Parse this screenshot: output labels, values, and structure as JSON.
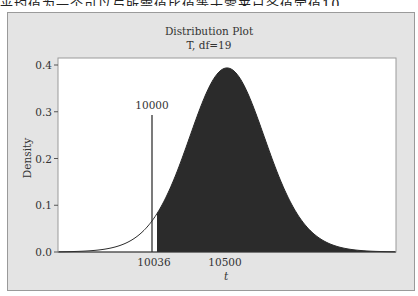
{
  "page_fragment": "平均值为一个可以与所需值比值等于零来已各值定值10",
  "chart_data": {
    "type": "area",
    "title": "Distribution Plot",
    "subtitle": "T, df=19",
    "xlabel": "t",
    "ylabel": "Density",
    "distribution": "t",
    "df": 19,
    "yticks": [
      "0.0",
      "0.1",
      "0.2",
      "0.3",
      "0.4"
    ],
    "ylim": [
      0,
      0.42
    ],
    "xticks": [
      "10036",
      "10500"
    ],
    "xtick_values": [
      10036,
      10500
    ],
    "center": 10500,
    "shaded_region": {
      "from": 10036,
      "to": "right tail",
      "color": "#2b2b2b"
    },
    "reference_line": {
      "value": 10000,
      "label": "10000"
    },
    "peak_density": 0.394,
    "grid": false,
    "legend": "none"
  }
}
